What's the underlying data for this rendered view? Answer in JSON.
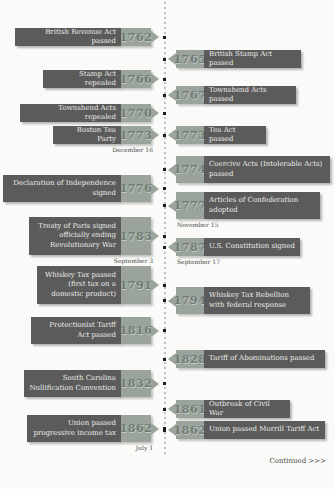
{
  "timeline": {
    "title_semantic": "American tax and revenue history timeline 1762-1862",
    "continued_label": "Continued >>>",
    "colors": {
      "background": "#fafaf8",
      "event_box": "#5b5b5b",
      "event_text": "#ebebe9",
      "year_box": "#9aa39c",
      "year_text": "#707b74",
      "date_text": "#4c4c4a",
      "dot": "#1c1c1c",
      "line_dot": "#c0c0bd"
    },
    "events": [
      {
        "side": "left",
        "year": "1762",
        "label": "British Revenue Act passed",
        "date": "",
        "top": 28,
        "height": 18,
        "width": 106
      },
      {
        "side": "right",
        "year": "1765",
        "label": "British Stamp Act passed",
        "date": "",
        "top": 50,
        "height": 18,
        "width": 97
      },
      {
        "side": "left",
        "year": "1766",
        "label": "Stamp Act repealed",
        "date": "",
        "top": 70,
        "height": 18,
        "width": 78
      },
      {
        "side": "right",
        "year": "1767",
        "label": "Townshend Acts passed",
        "date": "",
        "top": 86,
        "height": 18,
        "width": 92
      },
      {
        "side": "left",
        "year": "1770",
        "label": "Townshend Acts repealed",
        "date": "",
        "top": 104,
        "height": 18,
        "width": 101
      },
      {
        "side": "left",
        "year": "1773",
        "label": "Boston Tea Party",
        "date": "December 16",
        "top": 126,
        "height": 18,
        "width": 68
      },
      {
        "side": "right",
        "year": "1773",
        "label": "Tea Act passed",
        "date": "",
        "top": 126,
        "height": 18,
        "width": 62
      },
      {
        "side": "right",
        "year": "1774",
        "label": "Coercive Acts (Intolerable Acts) passed",
        "date": "",
        "top": 156,
        "height": 27,
        "width": 126
      },
      {
        "side": "left",
        "year": "1776",
        "label": "Declaration of Independence signed",
        "date": "",
        "top": 175,
        "height": 27,
        "width": 118
      },
      {
        "side": "right",
        "year": "1777",
        "label": "Articles of Confederation adopted",
        "date": "November 15",
        "top": 192,
        "height": 27,
        "width": 116
      },
      {
        "side": "left",
        "year": "1783",
        "label": "Treaty of Paris signed officially ending Revolutionary War",
        "date": "September 3",
        "top": 217,
        "height": 38,
        "width": 92
      },
      {
        "side": "right",
        "year": "1787",
        "label": "U.S. Constitution signed",
        "date": "September 17",
        "top": 238,
        "height": 18,
        "width": 96
      },
      {
        "side": "left",
        "year": "1791",
        "label": "Whiskey Tax passed (first tax on a domestic product)",
        "date": "",
        "top": 266,
        "height": 38,
        "width": 84
      },
      {
        "side": "right",
        "year": "1794",
        "label": "Whiskey Tax Rebellion with federal response",
        "date": "",
        "top": 287,
        "height": 27,
        "width": 106
      },
      {
        "side": "left",
        "year": "1816",
        "label": "Protectionist Tariff Act passed",
        "date": "",
        "top": 317,
        "height": 27,
        "width": 90
      },
      {
        "side": "right",
        "year": "1828",
        "label": "Tariff of Abominations passed",
        "date": "",
        "top": 350,
        "height": 18,
        "width": 121
      },
      {
        "side": "left",
        "year": "1832",
        "label": "South Carolina Nullification Convention",
        "date": "",
        "top": 370,
        "height": 27,
        "width": 97
      },
      {
        "side": "right",
        "year": "1861",
        "label": "Outbreak of Civil War",
        "date": "",
        "top": 400,
        "height": 18,
        "width": 86
      },
      {
        "side": "left",
        "year": "1862",
        "label": "Union passed progressive income tax",
        "date": "July 1",
        "top": 415,
        "height": 27,
        "width": 94
      },
      {
        "side": "right",
        "year": "1862",
        "label": "Union passed Morrill Tariff Act",
        "date": "",
        "top": 421,
        "height": 18,
        "width": 121
      }
    ]
  }
}
